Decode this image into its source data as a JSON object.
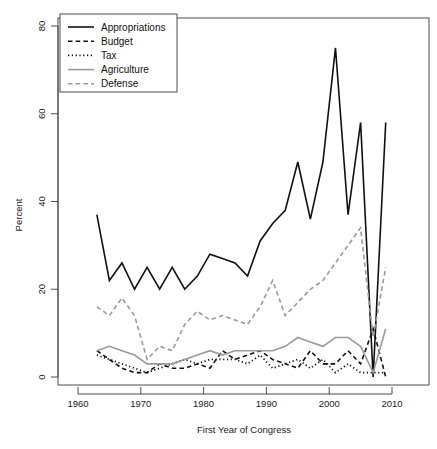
{
  "chart_data": {
    "type": "line",
    "title": "",
    "xlabel": "First Year of Congress",
    "ylabel": "Percent",
    "xlim": [
      1958,
      2012
    ],
    "ylim": [
      0,
      82
    ],
    "xticks": [
      1960,
      1970,
      1980,
      1990,
      2000,
      2010
    ],
    "yticks": [
      0,
      20,
      40,
      60,
      80
    ],
    "grid": false,
    "legend_position": "top-left",
    "x": [
      1963,
      1965,
      1967,
      1969,
      1971,
      1973,
      1975,
      1977,
      1979,
      1981,
      1983,
      1985,
      1987,
      1989,
      1991,
      1993,
      1995,
      1997,
      1999,
      2001,
      2003,
      2005,
      2007,
      2009
    ],
    "series": [
      {
        "name": "Appropriations",
        "color": "#111111",
        "dash": "solid",
        "width": 1.6,
        "values": [
          37,
          22,
          26,
          20,
          25,
          20,
          25,
          20,
          23,
          28,
          27,
          26,
          23,
          31,
          35,
          38,
          49,
          36,
          49,
          75,
          37,
          58,
          0,
          58
        ]
      },
      {
        "name": "Budget",
        "color": "#111111",
        "dash": "dashed",
        "width": 1.6,
        "values": [
          6,
          4,
          2,
          1,
          1,
          3,
          2,
          2,
          3,
          2,
          6,
          4,
          5,
          6,
          4,
          3,
          2,
          6,
          3,
          3,
          6,
          3,
          11,
          0
        ]
      },
      {
        "name": "Tax",
        "color": "#111111",
        "dash": "dotted",
        "width": 1.8,
        "values": [
          5,
          4,
          3,
          2,
          1,
          2,
          3,
          4,
          3,
          4,
          4,
          4,
          3,
          5,
          2,
          3,
          4,
          2,
          4,
          1,
          3,
          1,
          1,
          1
        ]
      },
      {
        "name": "Agriculture",
        "color": "#9a9a9a",
        "dash": "solid",
        "width": 1.6,
        "values": [
          6,
          7,
          6,
          5,
          3,
          3,
          3,
          4,
          5,
          6,
          5,
          6,
          6,
          6,
          6,
          7,
          9,
          8,
          7,
          9,
          9,
          7,
          1,
          11
        ]
      },
      {
        "name": "Defense",
        "color": "#9a9a9a",
        "dash": "dashed",
        "width": 1.6,
        "values": [
          16,
          14,
          18,
          14,
          4,
          7,
          6,
          12,
          15,
          13,
          14,
          13,
          12,
          16,
          22,
          14,
          17,
          20,
          22,
          26,
          30,
          34,
          9,
          25
        ]
      }
    ]
  },
  "legend": {
    "items": [
      {
        "label": "Appropriations"
      },
      {
        "label": "Budget"
      },
      {
        "label": "Tax"
      },
      {
        "label": "Agriculture"
      },
      {
        "label": "Defense"
      }
    ]
  }
}
